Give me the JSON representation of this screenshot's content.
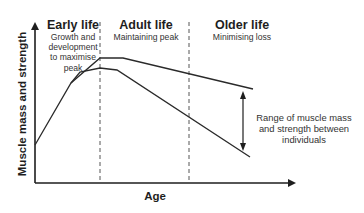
{
  "diagram": {
    "y_axis_label": "Muscle mass and strength",
    "x_axis_label": "Age",
    "phases": [
      {
        "title": "Early life",
        "description": [
          "Growth and",
          "development",
          "to maximise",
          "peak"
        ]
      },
      {
        "title": "Adult life",
        "description": [
          "Maintaining peak"
        ]
      },
      {
        "title": "Older life",
        "description": [
          "Minimising loss"
        ]
      }
    ],
    "range_annotation": [
      "Range of muscle mass",
      "and strength between",
      "individuals"
    ],
    "curves": [
      {
        "name": "upper-bound",
        "points": [
          [
            35,
            145
          ],
          [
            71,
            83
          ],
          [
            100,
            58
          ],
          [
            123,
            58
          ],
          [
            253,
            89
          ]
        ]
      },
      {
        "name": "lower-bound",
        "points": [
          [
            35,
            145
          ],
          [
            71,
            83
          ],
          [
            80,
            72
          ],
          [
            100,
            68
          ],
          [
            117,
            70
          ],
          [
            250,
            157
          ]
        ]
      }
    ],
    "colors": {
      "line": "#2a2a2a",
      "text": "#1e1e1e",
      "dash": "#555555"
    }
  }
}
